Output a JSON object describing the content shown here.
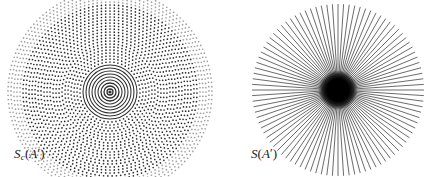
{
  "figure": {
    "background_color": "#ffffff",
    "ink_color": "#2b2b2b",
    "width": 442,
    "height": 177,
    "panels": [
      {
        "id": "left",
        "label": {
          "full_text": "Sc(A')",
          "base": "S",
          "subscript": "c",
          "open_paren": "(",
          "argument": "A",
          "prime": "′",
          "close_paren": ")"
        }
      },
      {
        "id": "right",
        "label": {
          "full_text": "S(A')",
          "base": "S",
          "subscript": "",
          "open_paren": "(",
          "argument": "A",
          "prime": "′",
          "close_paren": ")"
        }
      }
    ]
  },
  "chart_data": [
    {
      "type": "scatter",
      "id": "left-dotted-disc",
      "title": "Sc(A')",
      "description": "Polar grid of dots: concentric rings of points along evenly spaced radial directions, densest at the center where rings merge into solid circles.",
      "coordinate_system": "polar",
      "center": [
        110,
        92
      ],
      "radius": 88,
      "grid": false,
      "legend": null,
      "xlabel": "",
      "ylabel": "",
      "rings": 34,
      "spokes": 72,
      "ring_radii": [
        3,
        6,
        9,
        12,
        15,
        18,
        21,
        24,
        27,
        30,
        33,
        36,
        39,
        42,
        45,
        48,
        51,
        54,
        57,
        60,
        63,
        66,
        69,
        72,
        75,
        78,
        81,
        84,
        87,
        90,
        93,
        96,
        99,
        102
      ],
      "dot_radius_px": 0.85,
      "solid_inner_ring_count": 9,
      "ink_color": "#2f2f2f"
    },
    {
      "type": "line",
      "id": "right-starburst",
      "title": "S(A')",
      "description": "Radial starburst: straight line segments emanating from a common center to a circular boundary, overlapping into a solid black core.",
      "coordinate_system": "polar",
      "center": [
        117,
        90
      ],
      "radius": 86,
      "grid": false,
      "legend": null,
      "xlabel": "",
      "ylabel": "",
      "spokes": 96,
      "angle_step_degrees": 3.75,
      "line_width_px": 0.7,
      "core_radius_px": 13,
      "ink_color": "#2b2b2b"
    }
  ]
}
